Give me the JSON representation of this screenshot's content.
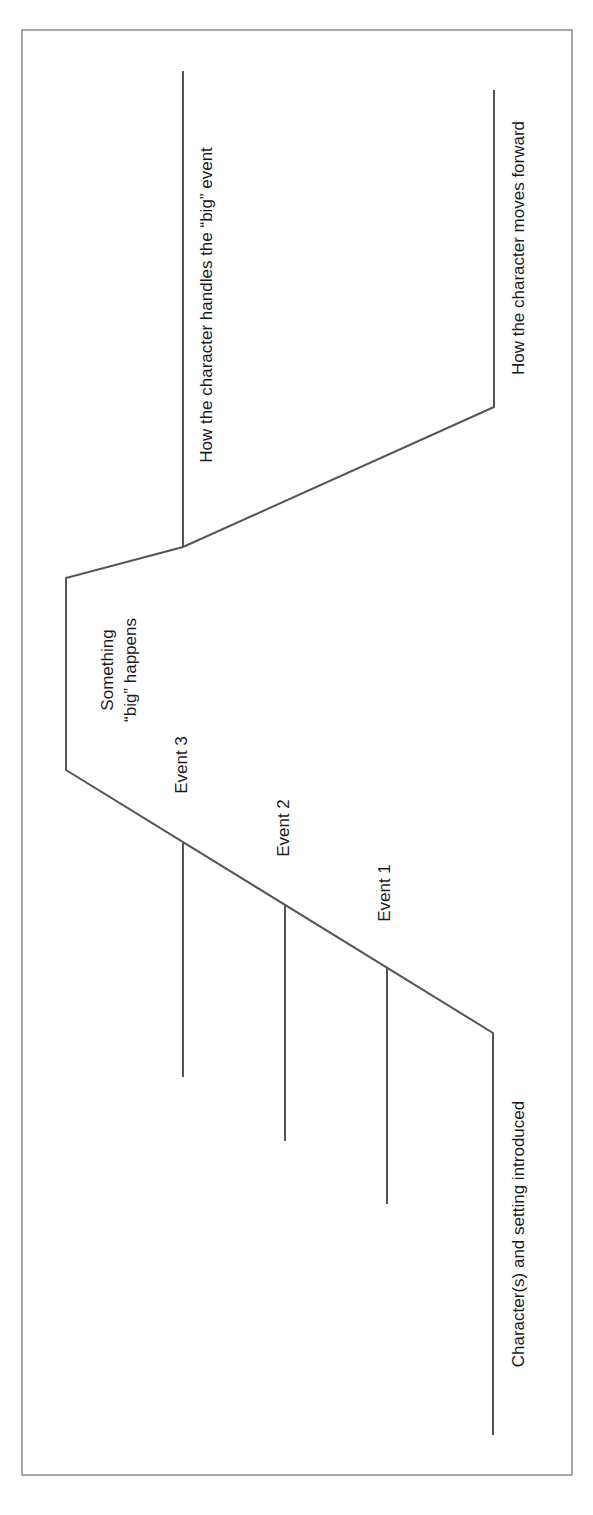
{
  "diagram": {
    "type": "plot-line / story arc (rotated 90°)",
    "orientation": "rotated counterclockwise; text reads bottom-to-top",
    "colors": {
      "line": "#555555",
      "frame": "#7a7a7a",
      "text": "#1a1a1a"
    },
    "labels": {
      "beginning": "Character(s) and setting introduced",
      "event1": "Event 1",
      "event2": "Event 2",
      "event3": "Event 3",
      "climax_line1": "Something",
      "climax_line2": "“big” happens",
      "falling_action": "How the character handles the “big” event",
      "resolution": "How the character moves forward"
    },
    "stages": [
      "Character(s) and setting introduced",
      "Event 1",
      "Event 2",
      "Event 3",
      "Something “big” happens",
      "How the character handles the “big” event",
      "How the character moves forward"
    ]
  }
}
